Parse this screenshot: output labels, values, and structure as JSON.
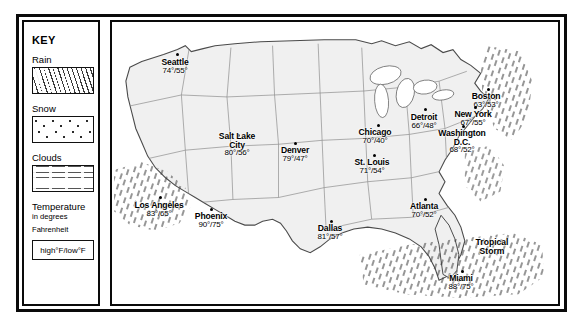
{
  "key": {
    "title": "KEY",
    "entries": [
      {
        "label": "Rain",
        "pattern": "diagonal-dashes"
      },
      {
        "label": "Snow",
        "pattern": "dots"
      },
      {
        "label": "Clouds",
        "pattern": "horizontal-wavy-lines"
      }
    ],
    "temperature": {
      "title": "Temperature",
      "subtitle": "in degrees\nFahrenheit",
      "sub_line1": "in degrees",
      "sub_line2": "Fahrenheit",
      "sample": "high°F/low°F"
    }
  },
  "map": {
    "annotations": [
      {
        "text_line1": "Tropical",
        "text_line2": "Storm",
        "x": 372,
        "y": 218
      }
    ],
    "cities": [
      {
        "name": "Seattle",
        "high": 74,
        "low": 55,
        "temp": "74°/55°",
        "x": 62,
        "y": 36,
        "dot_x": 64,
        "dot_y": 31
      },
      {
        "name": "Salt Lake City",
        "name_line1": "Salt Lake",
        "name_line2": "City",
        "high": 80,
        "low": 56,
        "temp": "80°/56°",
        "x": 108,
        "y": 112,
        "dot_x": 125,
        "dot_y": 112
      },
      {
        "name": "Denver",
        "high": 79,
        "low": 47,
        "temp": "79°/47°",
        "x": 171,
        "y": 126,
        "dot_x": 182,
        "dot_y": 120
      },
      {
        "name": "Los Angeles",
        "high": 83,
        "low": 65,
        "temp": "83°/65°",
        "x": 32,
        "y": 180,
        "dot_x": 47,
        "dot_y": 174
      },
      {
        "name": "Phoenix",
        "high": 90,
        "low": 75,
        "temp": "90°/75°",
        "x": 86,
        "y": 191,
        "dot_x": 98,
        "dot_y": 186
      },
      {
        "name": "Dallas",
        "high": 81,
        "low": 57,
        "temp": "81°/57°",
        "x": 207,
        "y": 203,
        "dot_x": 218,
        "dot_y": 198
      },
      {
        "name": "Chicago",
        "high": 70,
        "low": 40,
        "temp": "70°/40°",
        "x": 251,
        "y": 107,
        "dot_x": 265,
        "dot_y": 102
      },
      {
        "name": "St. Louis",
        "high": 71,
        "low": 54,
        "temp": "71°/54°",
        "x": 249,
        "y": 137,
        "dot_x": 261,
        "dot_y": 132
      },
      {
        "name": "Detroit",
        "high": 66,
        "low": 48,
        "temp": "66°/48°",
        "x": 302,
        "y": 92,
        "dot_x": 312,
        "dot_y": 86
      },
      {
        "name": "Atlanta",
        "high": 70,
        "low": 52,
        "temp": "70°/52°",
        "x": 300,
        "y": 181,
        "dot_x": 312,
        "dot_y": 176
      },
      {
        "name": "Boston",
        "high": 63,
        "low": 53,
        "temp": "63°/53°",
        "x": 363,
        "y": 71,
        "dot_x": 375,
        "dot_y": 66
      },
      {
        "name": "New York",
        "high": 67,
        "low": 55,
        "temp": "67°/55°",
        "x": 351,
        "y": 89,
        "dot_x": 362,
        "dot_y": 84
      },
      {
        "name": "Washington D.C.",
        "name_line1": "Washington",
        "name_line2": "D.C.",
        "high": 68,
        "low": 52,
        "temp": "68°/52°",
        "x": 332,
        "y": 108,
        "dot_x": 350,
        "dot_y": 103
      },
      {
        "name": "Miami",
        "high": 88,
        "low": 75,
        "temp": "88°/75°",
        "x": 338,
        "y": 253,
        "dot_x": 349,
        "dot_y": 248
      }
    ]
  }
}
